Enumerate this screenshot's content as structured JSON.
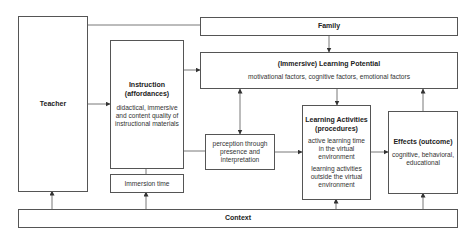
{
  "nodes": {
    "teacher": {
      "title": "Teacher"
    },
    "family": {
      "title": "Family"
    },
    "instruction": {
      "title_line1": "Instruction",
      "title_line2": "(affordances)",
      "body_line1": "didactical, immersive",
      "body_line2": "and content quality of",
      "body_line3": "instructional materials"
    },
    "immersion_time": {
      "title": "Immersion time"
    },
    "learning_potential": {
      "title": "(Immersive) Learning Potential",
      "body": "motivational factors, cognitive factors, emotional factors"
    },
    "perception": {
      "line1": "perception through",
      "line2": "presence and",
      "line3": "interpretation"
    },
    "learning_activities": {
      "title_line1": "Learning Activities",
      "title_line2": "(procedures)",
      "body1_line1": "active learning time",
      "body1_line2": "in the virtual",
      "body1_line3": "environment",
      "body2_line1": "learning activities",
      "body2_line2": "outside the virtual",
      "body2_line3": "environment"
    },
    "effects": {
      "title": "Effects (outcome)",
      "body_line1": "cognitive, behavioral,",
      "body_line2": "educational"
    },
    "context": {
      "title": "Context"
    }
  },
  "edges": [
    {
      "from": "teacher",
      "to": "family",
      "type": "line"
    },
    {
      "from": "teacher",
      "to": "instruction",
      "type": "arrow"
    },
    {
      "from": "family",
      "to": "learning_potential",
      "type": "arrow"
    },
    {
      "from": "instruction",
      "to": "learning_potential",
      "type": "arrow"
    },
    {
      "from": "instruction",
      "to": "perception",
      "type": "line"
    },
    {
      "from": "learning_potential",
      "to": "perception",
      "type": "bidirectional"
    },
    {
      "from": "learning_potential",
      "to": "learning_activities",
      "type": "arrow"
    },
    {
      "from": "perception",
      "to": "learning_activities",
      "type": "arrow"
    },
    {
      "from": "learning_activities",
      "to": "effects",
      "type": "arrow"
    },
    {
      "from": "effects",
      "to": "learning_potential",
      "type": "arrow"
    },
    {
      "from": "immersion_time",
      "to": "instruction",
      "type": "line"
    },
    {
      "from": "context",
      "to": "teacher",
      "type": "arrow"
    },
    {
      "from": "context",
      "to": "immersion_time",
      "type": "arrow"
    },
    {
      "from": "context",
      "to": "learning_activities",
      "type": "arrow"
    },
    {
      "from": "context",
      "to": "effects",
      "type": "arrow"
    }
  ],
  "colors": {
    "stroke": "#555555",
    "text": "#222222",
    "background": "#ffffff"
  }
}
